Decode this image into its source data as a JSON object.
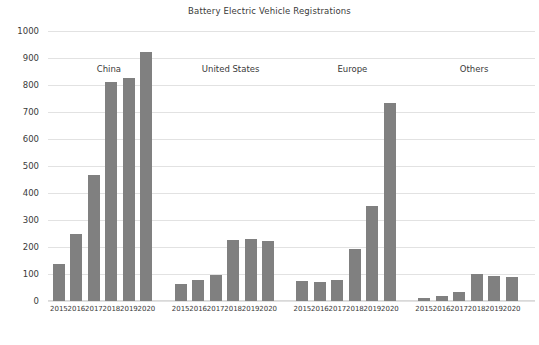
{
  "chart_data": {
    "type": "bar",
    "title": "Battery Electric Vehicle Registrations",
    "xlabel": "",
    "ylabel": "",
    "ylim": [
      0,
      1000
    ],
    "ytick_step": 100,
    "yticks": [
      "1000",
      "900",
      "800",
      "700",
      "600",
      "500",
      "400",
      "300",
      "200",
      "100",
      "0"
    ],
    "grid": true,
    "legend": "none",
    "bar_color": "#808080",
    "categories": [
      "2015",
      "2016",
      "2017",
      "2018",
      "2019",
      "2020"
    ],
    "groups": [
      {
        "name": "China",
        "x": [
          "2015",
          "2016",
          "2017",
          "2018",
          "2019",
          "2020"
        ],
        "values": [
          137,
          247,
          465,
          810,
          825,
          922
        ]
      },
      {
        "name": "United States",
        "x": [
          "2015",
          "2016",
          "2017",
          "2018",
          "2019",
          "2020"
        ],
        "values": [
          63,
          79,
          97,
          225,
          230,
          222
        ]
      },
      {
        "name": "Europe",
        "x": [
          "2015",
          "2016",
          "2017",
          "2018",
          "2019",
          "2020"
        ],
        "values": [
          73,
          70,
          78,
          194,
          352,
          735
        ]
      },
      {
        "name": "Others",
        "x": [
          "2015",
          "2016",
          "2017",
          "2018",
          "2019",
          "2020"
        ],
        "values": [
          10,
          17,
          33,
          100,
          92,
          90
        ]
      }
    ]
  }
}
